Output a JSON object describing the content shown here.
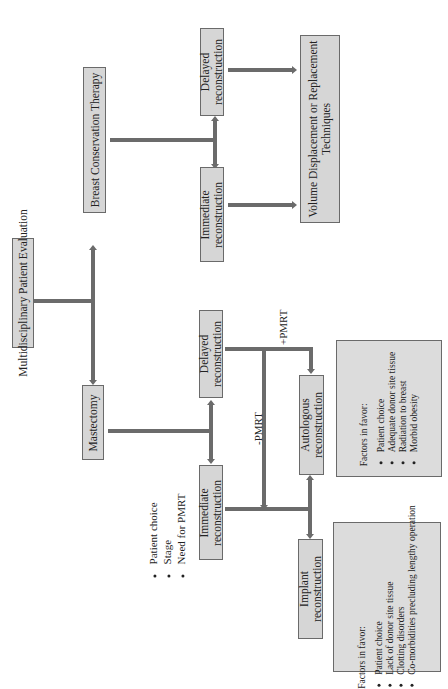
{
  "diagram": {
    "root": {
      "label": "Multidisciplinary Patient Evaluation"
    },
    "mastectomy": {
      "label": "Mastectomy",
      "considerations": [
        "Patient choice",
        "Stage",
        "Need for PMRT"
      ],
      "immediate": {
        "label_line1": "Immediate",
        "label_line2": "reconstruction"
      },
      "delayed": {
        "label_line1": "Delayed",
        "label_line2": "reconstruction"
      },
      "edge_minus_pmrt": "-PMRT",
      "edge_plus_pmrt": "+PMRT",
      "implant": {
        "label_line1": "Implant",
        "label_line2": "reconstruction",
        "factors_title": "Factors in favor:",
        "factors": [
          "Patient choice",
          "Lack of donor site tissue",
          "Clotting disorders",
          "Co-morbidities precluding lengthy operation"
        ]
      },
      "autologous": {
        "label_line1": "Autologous",
        "label_line2": "reconstruction",
        "factors_title": "Factors in favor:",
        "factors": [
          "Patient choice",
          "Adequate donor site tissue",
          "Radiation to breast",
          "Morbid obesity"
        ]
      }
    },
    "bct": {
      "label": "Breast Conservation Therapy",
      "immediate": {
        "label_line1": "Immediate",
        "label_line2": "reconstruction"
      },
      "delayed": {
        "label_line1": "Delayed",
        "label_line2": "reconstruction"
      },
      "outcome": {
        "label_line1": "Volume Displacement or Replacement",
        "label_line2": "Techniques"
      }
    }
  }
}
